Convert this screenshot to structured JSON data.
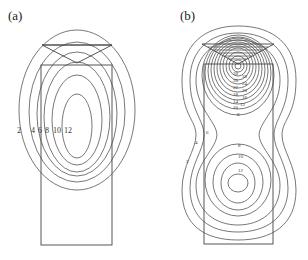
{
  "figure": {
    "panels": [
      {
        "id": "a",
        "label": "(a)",
        "contour_levels": [
          "2",
          "4",
          "6",
          "8",
          "10",
          "12"
        ]
      },
      {
        "id": "b",
        "label": "(b)",
        "contour_levels_top": [
          "8",
          "10",
          "12",
          "14",
          "16",
          "18",
          "20",
          "22",
          "24",
          "26",
          "28",
          "30"
        ],
        "contour_levels_outer": [
          "2",
          "4",
          "6"
        ],
        "contour_levels_bottom": [
          "8",
          "10",
          "12"
        ]
      }
    ]
  }
}
